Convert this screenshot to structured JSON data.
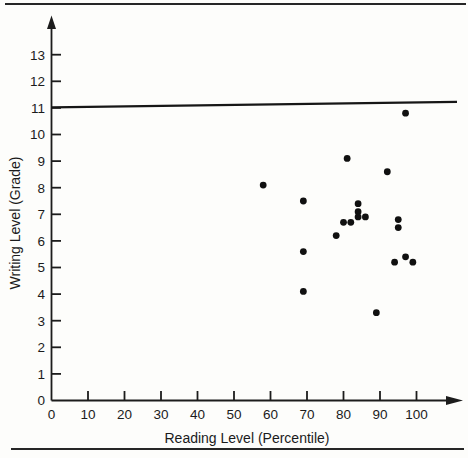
{
  "figure": {
    "background": "#fdfdfb",
    "ink": "#1b1b1b",
    "dot_color": "#101010"
  },
  "chart_data": {
    "type": "scatter",
    "title": "",
    "xlabel": "Reading Level (Percentile)",
    "ylabel": "Writing Level (Grade)",
    "xlim": [
      0,
      113
    ],
    "ylim": [
      0,
      14.4
    ],
    "x_ticks": [
      0,
      10,
      20,
      30,
      40,
      50,
      60,
      70,
      80,
      90,
      100
    ],
    "y_ticks": [
      0,
      1,
      2,
      3,
      4,
      5,
      6,
      7,
      8,
      9,
      10,
      11,
      12,
      13
    ],
    "grid": false,
    "legend": false,
    "reference_line": {
      "axis": "y",
      "value": 11
    },
    "points": [
      [
        58,
        8.1
      ],
      [
        69,
        7.5
      ],
      [
        69,
        5.6
      ],
      [
        69,
        4.1
      ],
      [
        78,
        6.2
      ],
      [
        80,
        6.7
      ],
      [
        81,
        9.1
      ],
      [
        82,
        6.7
      ],
      [
        84,
        7.4
      ],
      [
        84,
        7.1
      ],
      [
        84,
        6.9
      ],
      [
        86,
        6.9
      ],
      [
        89,
        3.3
      ],
      [
        92,
        8.6
      ],
      [
        94,
        5.2
      ],
      [
        95,
        6.8
      ],
      [
        95,
        6.5
      ],
      [
        97,
        5.4
      ],
      [
        97,
        10.8
      ],
      [
        99,
        5.2
      ]
    ]
  }
}
